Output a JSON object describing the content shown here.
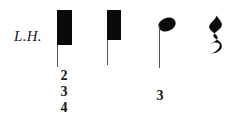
{
  "score": {
    "hand_indication": "L.H.",
    "symbols": [
      {
        "name": "cluster-block-1",
        "type": "tone-cluster-block",
        "stem_direction": "down",
        "fingerings": [
          "2",
          "3",
          "4"
        ]
      },
      {
        "name": "cluster-block-2",
        "type": "tone-cluster-block",
        "stem_direction": "down",
        "fingerings": []
      },
      {
        "name": "quarter-note",
        "type": "quarter-note",
        "stem_direction": "down",
        "fingerings": [
          "3"
        ]
      },
      {
        "name": "quarter-rest",
        "type": "quarter-rest",
        "glyph": "quarter-rest-glyph",
        "fingerings": []
      }
    ],
    "fingering_group_1": {
      "first": "2",
      "second": "3",
      "third": "4"
    },
    "fingering_group_2": {
      "first": "3"
    },
    "colors": {
      "ink": "#0a0a0a",
      "stem": "#55565a",
      "paper": "#ffffff"
    }
  }
}
